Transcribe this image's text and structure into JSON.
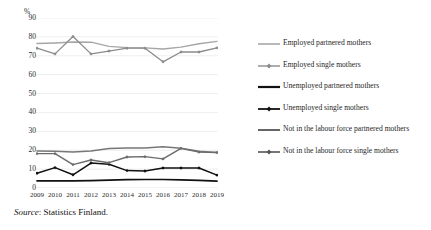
{
  "figure": {
    "unit_label": "%",
    "source_prefix": "Source",
    "source_separator": ": ",
    "source_text": "Statistics Finland."
  },
  "chart_data": {
    "type": "line",
    "title": "",
    "xlabel": "",
    "ylabel": "%",
    "ylim": [
      0,
      90
    ],
    "ytick_step": 10,
    "grid": true,
    "legend_position": "right",
    "x": [
      2009,
      2010,
      2011,
      2012,
      2013,
      2014,
      2015,
      2016,
      2017,
      2018,
      2019
    ],
    "categories": [
      "2009",
      "2010",
      "2011",
      "2012",
      "2013",
      "2014",
      "2015",
      "2016",
      "2017",
      "2018",
      "2019"
    ],
    "yticks": [
      0,
      10,
      20,
      30,
      40,
      50,
      60,
      70,
      80,
      90
    ],
    "series": [
      {
        "name": "Employed  partnered mothers",
        "key": "employed-partnered",
        "color": "#a6a6a6",
        "width": 1.4,
        "markers": false,
        "values": [
          76.5,
          76.8,
          77.3,
          77.2,
          75.0,
          74.3,
          74.2,
          73.6,
          74.6,
          76.4,
          77.6
        ]
      },
      {
        "name": "Employed  single mothers",
        "key": "employed-single",
        "color": "#8c8c8c",
        "width": 1.3,
        "markers": true,
        "values": [
          74.0,
          71.0,
          80.2,
          71.0,
          72.5,
          74.0,
          74.0,
          66.8,
          72.0,
          72.0,
          74.2
        ]
      },
      {
        "name": "Unemployed partnered mothers",
        "key": "unemployed-partnered",
        "color": "#111111",
        "width": 1.7,
        "markers": false,
        "values": [
          3.8,
          3.8,
          3.8,
          3.9,
          4.2,
          4.4,
          4.5,
          4.5,
          4.3,
          4.0,
          3.6
        ]
      },
      {
        "name": "Unemployed single mothers",
        "key": "unemployed-single",
        "color": "#111111",
        "width": 1.5,
        "markers": true,
        "values": [
          7.8,
          10.8,
          7.0,
          13.2,
          12.6,
          9.2,
          9.0,
          10.6,
          10.6,
          10.6,
          6.8
        ]
      },
      {
        "name": "Not in the labour force partnered mothers",
        "key": "nilf-partnered",
        "color": "#777777",
        "width": 1.5,
        "markers": false,
        "values": [
          19.6,
          19.4,
          19.0,
          19.6,
          20.9,
          21.2,
          21.2,
          21.8,
          21.0,
          19.5,
          18.8
        ]
      },
      {
        "name": "Not in the labour force single mothers",
        "key": "nilf-single",
        "color": "#6b6b6b",
        "width": 1.4,
        "markers": true,
        "values": [
          18.2,
          18.2,
          12.4,
          14.8,
          13.4,
          16.4,
          16.6,
          15.4,
          21.0,
          19.0,
          18.8
        ]
      }
    ]
  },
  "legend": {
    "items": [
      {
        "label": "Employed  partnered mothers",
        "color": "#a6a6a6",
        "markers": false,
        "width": 1.6
      },
      {
        "label": "Employed  single mothers",
        "color": "#8c8c8c",
        "markers": true,
        "width": 1.4
      },
      {
        "label": "Unemployed partnered mothers",
        "color": "#111111",
        "markers": false,
        "width": 2.2
      },
      {
        "label": "Unemployed single mothers",
        "color": "#111111",
        "markers": true,
        "width": 1.8
      },
      {
        "label": "Not in the labour force partnered mothers",
        "color": "#555555",
        "markers": false,
        "width": 1.8
      },
      {
        "label": "Not in the labour force single mothers",
        "color": "#555555",
        "markers": true,
        "width": 1.6
      }
    ]
  }
}
